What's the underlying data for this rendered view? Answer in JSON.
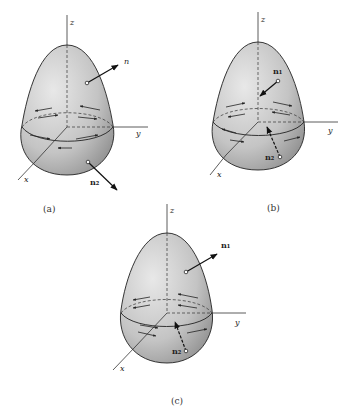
{
  "figures": [
    {
      "id": "a",
      "caption": "(a)",
      "axes": {
        "x": "x",
        "y": "y",
        "z": "z"
      },
      "normals": [
        {
          "label": "n",
          "direction": "outward",
          "position": "upper"
        },
        {
          "label": "n₂",
          "direction": "outward",
          "position": "lower"
        }
      ]
    },
    {
      "id": "b",
      "caption": "(b)",
      "axes": {
        "x": "x",
        "y": "y",
        "z": "z"
      },
      "normals": [
        {
          "label": "n₁",
          "direction": "inward",
          "position": "upper"
        },
        {
          "label": "n₂",
          "direction": "inward",
          "position": "lower"
        }
      ]
    },
    {
      "id": "c",
      "caption": "(c)",
      "axes": {
        "x": "x",
        "y": "y",
        "z": "z"
      },
      "normals": [
        {
          "label": "n₁",
          "direction": "outward",
          "position": "upper"
        },
        {
          "label": "n₂",
          "direction": "inward",
          "position": "lower"
        }
      ]
    }
  ],
  "colors": {
    "surface_light": "#e4e4e4",
    "surface_dark": "#9a9a9a",
    "line": "#222222"
  }
}
